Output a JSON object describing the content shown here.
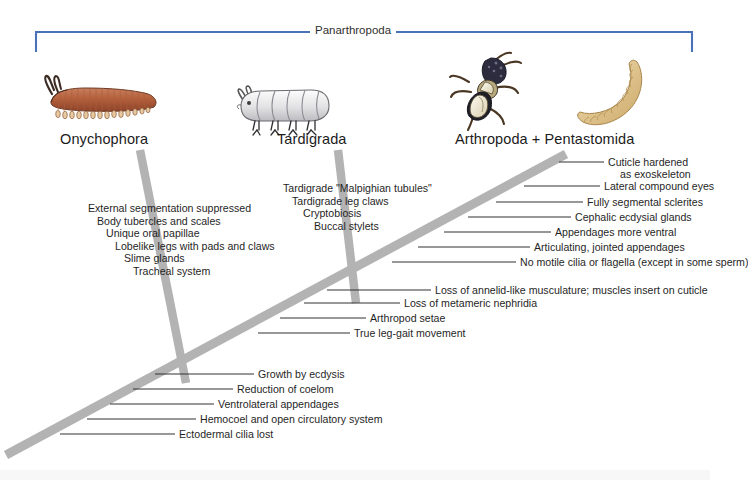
{
  "figure": {
    "type": "cladogram",
    "bracket_title": "Panarthropoda",
    "bracket_color": "#4a72b8",
    "branch_color": "#b0b0b0",
    "leader_color": "#333333"
  },
  "taxa": [
    {
      "name": "Onychophora",
      "icon": "velvet-worm-illustration"
    },
    {
      "name": "Tardigrada",
      "icon": "water-bear-illustration"
    },
    {
      "name": "Arthropoda  +  Pentastomida",
      "icon": "insect-illustration"
    },
    {
      "name": "",
      "icon": "pentastomid-illustration"
    }
  ],
  "synapomorphies": {
    "onychophora": [
      "External segmentation suppressed",
      "Body tubercles and scales",
      "Unique oral papillae",
      "Lobelike legs with pads and claws",
      "Slime glands",
      "Tracheal system"
    ],
    "tardigrada": [
      "Tardigrade \"Malpighian tubules\"",
      "Tardigrade leg claws",
      "Cryptobiosis",
      "Buccal stylets"
    ],
    "arthropoda_upper": [
      {
        "line1": "Cuticle hardened",
        "line2": "as exoskeleton"
      }
    ],
    "arthropoda": [
      "Lateral compound eyes",
      "Fully segmental sclerites",
      "Cephalic ecdysial glands",
      "Appendages more ventral",
      "Articulating, jointed appendages",
      "No motile cilia or flagella (except in some sperm)"
    ],
    "panarthropoda_node": [
      "Loss of annelid-like musculature; muscles insert on cuticle",
      "Loss of metameric nephridia",
      "Arthropod setae",
      "True leg-gait movement"
    ],
    "stem_base": [
      "Growth by ecdysis",
      "Reduction of coelom",
      "Ventrolateral appendages",
      "Hemocoel and open circulatory system",
      "Ectodermal cilia lost"
    ]
  }
}
